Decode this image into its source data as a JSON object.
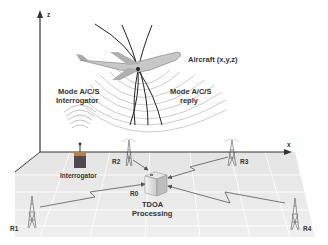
{
  "diagram": {
    "axes": {
      "z_label": "z",
      "x_label": "x"
    },
    "aircraft": {
      "label": "Aircraft (x,y,z)"
    },
    "interrogator_signal": {
      "label_line1": "Mode A/C/S",
      "label_line2": "Interrogator"
    },
    "reply_signal": {
      "label_line1": "Mode A/C/S",
      "label_line2": "reply"
    },
    "interrogator": {
      "label": "Interrogator"
    },
    "processing": {
      "station_label": "R0",
      "label_line1": "TDOA",
      "label_line2": "Processing"
    },
    "receivers": [
      {
        "id": "R1",
        "label": "R1"
      },
      {
        "id": "R2",
        "label": "R2"
      },
      {
        "id": "R3",
        "label": "R3"
      },
      {
        "id": "R4",
        "label": "R4"
      }
    ],
    "colors": {
      "ground": "#e6e6e6",
      "grid": "#ffffff",
      "axis": "#333333",
      "interrogator_body": "#3a5060",
      "link": "#555555",
      "text": "#333333"
    }
  }
}
